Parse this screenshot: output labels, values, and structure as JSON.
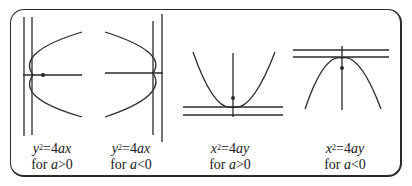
{
  "figure": {
    "stroke_color": "#2a2a2a",
    "panels": [
      {
        "id": "right-opening",
        "equation": {
          "lhs_var": "y",
          "exponent": "2",
          "eq": "=",
          "coef": "4",
          "rhs_vars": "ax"
        },
        "condition": {
          "prefix": "for ",
          "var": "a",
          "rel": ">0"
        }
      },
      {
        "id": "left-opening",
        "equation": {
          "lhs_var": "y",
          "exponent": "2",
          "eq": "=",
          "coef": "4",
          "rhs_vars": "ax"
        },
        "condition": {
          "prefix": "for ",
          "var": "a",
          "rel": "<0"
        }
      },
      {
        "id": "upward-opening",
        "equation": {
          "lhs_var": "x",
          "exponent": "2",
          "eq": "=",
          "coef": "4",
          "rhs_vars": "ay"
        },
        "condition": {
          "prefix": "for ",
          "var": "a",
          "rel": ">0"
        }
      },
      {
        "id": "downward-opening",
        "equation": {
          "lhs_var": "x",
          "exponent": "2",
          "eq": "=",
          "coef": "4",
          "rhs_vars": "ay"
        },
        "condition": {
          "prefix": "for ",
          "var": "a",
          "rel": "<0"
        }
      }
    ]
  }
}
